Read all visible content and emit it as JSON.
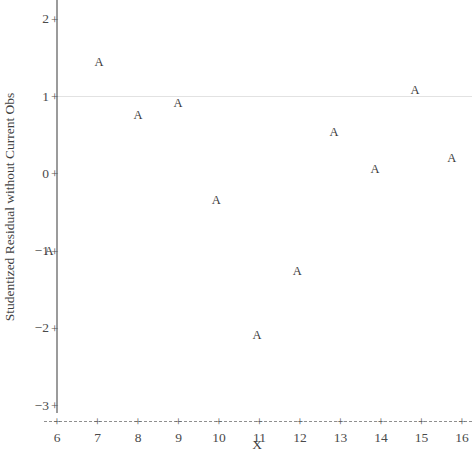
{
  "chart_data": {
    "type": "scatter",
    "title": "",
    "xlabel": "X",
    "ylabel": "Studentized Residual without Current Obs",
    "xlim": [
      5.6,
      16.3
    ],
    "ylim": [
      -3.35,
      2.3
    ],
    "xticks": [
      6,
      7,
      8,
      9,
      10,
      11,
      12,
      13,
      14,
      15,
      16
    ],
    "xtick_labels": [
      "6",
      "7",
      "8",
      "9",
      "10",
      "11",
      "12",
      "13",
      "14",
      "15",
      "16"
    ],
    "yticks": [
      2,
      1,
      0,
      -1,
      -2,
      -3
    ],
    "ytick_labels": [
      "2",
      "1",
      "0",
      "−1",
      "−2",
      "−3"
    ],
    "tick_glyph": "+",
    "marker_label": "A",
    "grid": false,
    "legend": null,
    "reference_lines": [
      {
        "name": "y-reference-line",
        "orientation": "horizontal",
        "value": 1
      }
    ],
    "points": [
      {
        "x": 5.8,
        "y": -1.0
      },
      {
        "x": 7.04,
        "y": 1.44
      },
      {
        "x": 8.0,
        "y": 0.75
      },
      {
        "x": 8.99,
        "y": 0.91
      },
      {
        "x": 9.93,
        "y": -0.35
      },
      {
        "x": 10.94,
        "y": -2.09
      },
      {
        "x": 11.93,
        "y": -1.26
      },
      {
        "x": 12.84,
        "y": 0.53
      },
      {
        "x": 13.85,
        "y": 0.06
      },
      {
        "x": 14.84,
        "y": 1.08
      },
      {
        "x": 15.75,
        "y": 0.2
      }
    ]
  },
  "colors": {
    "background": "#ffffff",
    "axis": "#9b9b9b",
    "text": "#3f3f3f",
    "marker": "#3b3b3b",
    "reference_line": "#e2e2e2"
  }
}
